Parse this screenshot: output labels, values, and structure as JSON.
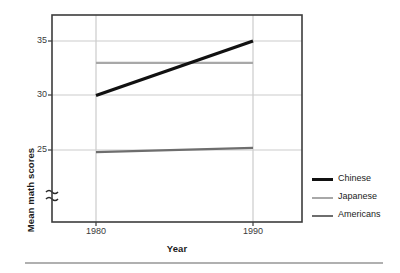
{
  "chart_data": {
    "type": "line",
    "title": "",
    "subtitle": "",
    "xlabel": "Year",
    "ylabel": "Mean math scores",
    "x": [
      1980,
      1990
    ],
    "xtick_labels": [
      "1980",
      "1990"
    ],
    "ytick_labels": [
      "25",
      "30",
      "35"
    ],
    "yticks": [
      25,
      30,
      35
    ],
    "xlim": [
      1976,
      1994
    ],
    "ylim": [
      22.2,
      36.0
    ],
    "grid": true,
    "grid_axes": "both",
    "y_axis_break": true,
    "y_axis_break_symbol": "≈",
    "legend_position": "right-outside",
    "series": [
      {
        "name": "Chinese",
        "values": [
          30,
          35
        ],
        "color": "#111111",
        "line_width": 3.2
      },
      {
        "name": "Japanese",
        "values": [
          33,
          33
        ],
        "color": "#a8a8a8",
        "line_width": 2.2
      },
      {
        "name": "Americans",
        "values": [
          24.8,
          25.2
        ],
        "color": "#6e6e6e",
        "line_width": 2.2
      }
    ],
    "annotations": []
  },
  "axes": {
    "y_title": "Mean math scores",
    "x_title": "Year",
    "y_ticks": [
      {
        "label": "35"
      },
      {
        "label": "30"
      },
      {
        "label": "25"
      }
    ],
    "x_ticks": [
      {
        "label": "1980"
      },
      {
        "label": "1990"
      }
    ],
    "break_symbol": "≈"
  },
  "legend": {
    "entries": [
      {
        "label": "Chinese",
        "color": "#111111",
        "thickness": "3.2"
      },
      {
        "label": "Japanese",
        "color": "#a8a8a8",
        "thickness": "2.2"
      },
      {
        "label": "Americans",
        "color": "#6e6e6e",
        "thickness": "2.2"
      }
    ]
  },
  "colors": {
    "frame": "#3c3c3c",
    "grid": "#cccccc",
    "rule": "#b0b0b0",
    "text": "#1b1b1b",
    "tick_text": "#3a3a3a",
    "background": "#ffffff"
  }
}
